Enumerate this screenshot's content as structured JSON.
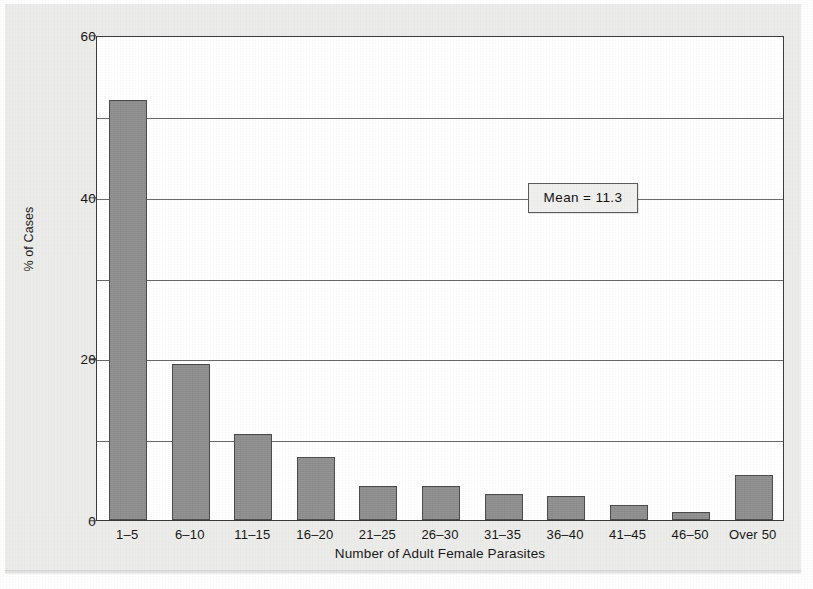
{
  "chart_data": {
    "type": "bar",
    "title": "",
    "xlabel": "Number of Adult Female Parasites",
    "ylabel": "% of Cases",
    "categories": [
      "1–5",
      "6–10",
      "11–15",
      "16–20",
      "21–25",
      "26–30",
      "31–35",
      "36–40",
      "41–45",
      "46–50",
      "Over 50"
    ],
    "values": [
      52.0,
      19.3,
      10.7,
      7.8,
      4.2,
      4.2,
      3.2,
      3.0,
      1.8,
      1.0,
      5.6
    ],
    "ylim": [
      0,
      60
    ],
    "ytick_labels": [
      "0",
      "20",
      "40",
      "60"
    ],
    "ytick_values": [
      0,
      20,
      40,
      60
    ],
    "gridline_values": [
      10,
      20,
      30,
      40,
      50
    ],
    "grid": true,
    "legend": "none",
    "bar_color": "#8f8f8f",
    "bar_edge_color": "#4a4a4a",
    "plot_background": "#ffffff",
    "page_background": "#ececea",
    "annotations": [
      {
        "name": "mean",
        "text": "Mean  =  11.3",
        "value": 11.3,
        "at_y": 40
      }
    ]
  }
}
